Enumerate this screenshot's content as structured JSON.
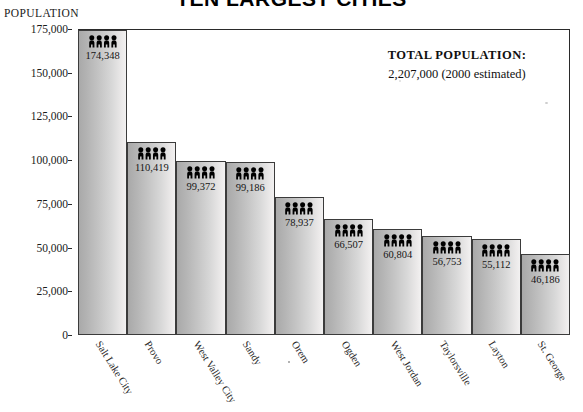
{
  "chart_data": {
    "type": "bar",
    "title": "TEN LARGEST CITIES",
    "xlabel": "",
    "ylabel": "POPULATION",
    "ylim": [
      0,
      175000
    ],
    "ytick_values": [
      175000,
      150000,
      125000,
      100000,
      75000,
      50000,
      25000,
      0
    ],
    "ytick_labels": [
      "175,000",
      "150,000",
      "125,000",
      "100,000",
      "75,000",
      "50,000",
      "25,000",
      "0"
    ],
    "grid": false,
    "legend": false,
    "categories": [
      "Salt Lake City",
      "Provo",
      "West Valley City",
      "Sandy",
      "Orem",
      "Ogden",
      "West Jordan",
      "Taylorsville",
      "Layton",
      "St. George"
    ],
    "values": [
      174348,
      110419,
      99372,
      99186,
      78937,
      66507,
      60804,
      56753,
      55112,
      46186
    ],
    "value_labels": [
      "174,348",
      "110,419",
      "99,372",
      "99,186",
      "78,937",
      "66,507",
      "60,804",
      "56,753",
      "55,112",
      "46,186"
    ],
    "bar_icon": "people-icon",
    "bar_icon_count": 4,
    "annotations": {
      "total_population_title": "TOTAL POPULATION:",
      "total_population_value": "2,207,000  (2000 estimated)"
    },
    "colors": {
      "bar_gradient_dark": "#a9a9a9",
      "bar_gradient_light": "#f2f1f1",
      "bar_border": "#3b3b3b",
      "frame": "#2a2a2a",
      "text": "#1a1a1a",
      "background": "#ffffff"
    }
  }
}
